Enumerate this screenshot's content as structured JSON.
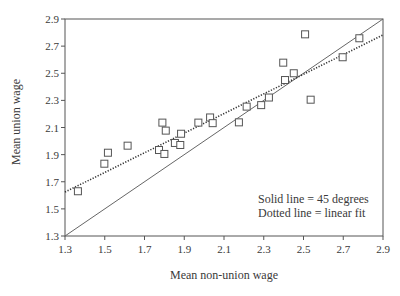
{
  "chart_data": {
    "type": "scatter",
    "title": "",
    "xlabel": "Mean non-union wage",
    "ylabel": "Mean union wage",
    "xlim": [
      1.3,
      2.9
    ],
    "ylim": [
      1.3,
      2.9
    ],
    "xticks": [
      "1.3",
      "1.5",
      "1.7",
      "1.9",
      "2.1",
      "2.3",
      "2.5",
      "2.7",
      "2.9"
    ],
    "yticks": [
      "1.3",
      "1.5",
      "1.7",
      "1.9",
      "2.1",
      "2.3",
      "2.5",
      "2.7",
      "2.9"
    ],
    "grid": false,
    "legend": null,
    "annotations": [
      "Solid line = 45 degrees",
      "Dotted line = linear fit"
    ],
    "series": [
      {
        "name": "Observations",
        "marker": "open-square",
        "points": [
          [
            1.365,
            1.63
          ],
          [
            1.498,
            1.833
          ],
          [
            1.516,
            1.914
          ],
          [
            1.615,
            1.966
          ],
          [
            1.773,
            1.934
          ],
          [
            1.79,
            2.136
          ],
          [
            1.807,
            2.077
          ],
          [
            1.8,
            1.905
          ],
          [
            1.853,
            1.986
          ],
          [
            1.88,
            1.971
          ],
          [
            1.884,
            2.054
          ],
          [
            1.971,
            2.136
          ],
          [
            2.03,
            2.174
          ],
          [
            2.043,
            2.132
          ],
          [
            2.175,
            2.138
          ],
          [
            2.214,
            2.254
          ],
          [
            2.287,
            2.265
          ],
          [
            2.326,
            2.321
          ],
          [
            2.398,
            2.578
          ],
          [
            2.407,
            2.45
          ],
          [
            2.451,
            2.5
          ],
          [
            2.508,
            2.787
          ],
          [
            2.536,
            2.305
          ],
          [
            2.697,
            2.618
          ],
          [
            2.781,
            2.758
          ]
        ]
      },
      {
        "name": "45 degree line",
        "style": "solid",
        "points": [
          [
            1.3,
            1.3
          ],
          [
            2.9,
            2.9
          ]
        ]
      },
      {
        "name": "Linear fit",
        "style": "dotted",
        "points": [
          [
            1.3,
            1.624
          ],
          [
            2.9,
            2.782
          ]
        ]
      }
    ]
  }
}
